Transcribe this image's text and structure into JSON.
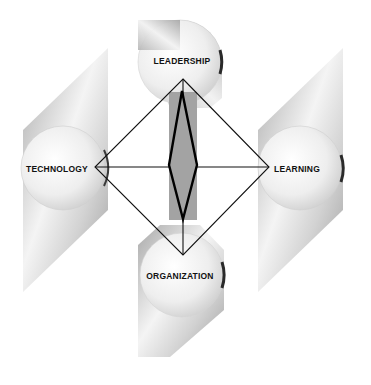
{
  "diagram": {
    "type": "four-pillar framework",
    "nodes": [
      {
        "id": "leadership",
        "label": "LEADERSHIP",
        "position": "top"
      },
      {
        "id": "technology",
        "label": "TECHNOLOGY",
        "position": "left"
      },
      {
        "id": "learning",
        "label": "LEARNING",
        "position": "right"
      },
      {
        "id": "organization",
        "label": "ORGANIZATION",
        "position": "bottom"
      }
    ],
    "edges": [
      {
        "from": "leadership",
        "to": "learning"
      },
      {
        "from": "learning",
        "to": "organization"
      },
      {
        "from": "organization",
        "to": "technology"
      },
      {
        "from": "technology",
        "to": "leadership"
      },
      {
        "from": "technology",
        "to": "learning"
      },
      {
        "from": "leadership",
        "to": "organization"
      }
    ],
    "center": {
      "shape": "thick-outlined narrow diamond on gray vertical bar"
    }
  },
  "colors": {
    "background": "#ffffff",
    "shape_gray": "#a8a8a8",
    "bar_gray": "#a3a3a3",
    "line": "#111111"
  }
}
